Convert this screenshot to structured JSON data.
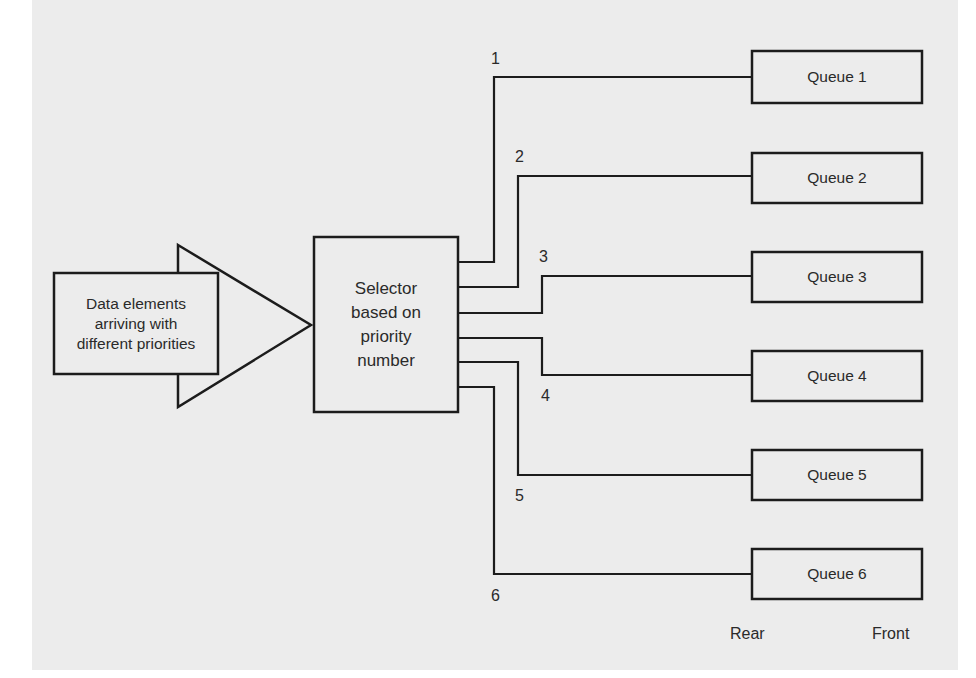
{
  "diagram": {
    "input": {
      "lines": [
        "Data elements",
        "arriving with",
        "different priorities"
      ]
    },
    "selector": {
      "lines": [
        "Selector",
        "based on",
        "priority",
        "number"
      ]
    },
    "channels": [
      {
        "number": "1",
        "queue": "Queue 1"
      },
      {
        "number": "2",
        "queue": "Queue 2"
      },
      {
        "number": "3",
        "queue": "Queue 3"
      },
      {
        "number": "4",
        "queue": "Queue 4"
      },
      {
        "number": "5",
        "queue": "Queue 5"
      },
      {
        "number": "6",
        "queue": "Queue 6"
      }
    ],
    "queue_end_labels": {
      "rear": "Rear",
      "front": "Front"
    }
  }
}
